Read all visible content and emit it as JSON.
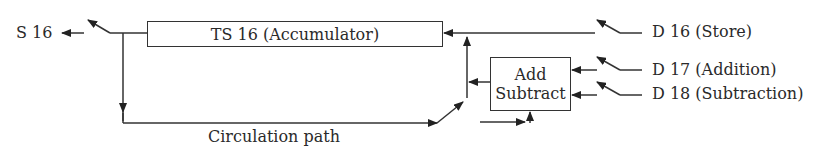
{
  "diagram": {
    "output_label": "S 16",
    "accumulator_label": "TS 16 (Accumulator)",
    "adder_label_line1": "Add",
    "adder_label_line2": "Subtract",
    "circulation_label": "Circulation path",
    "inputs": [
      {
        "label": "D 16 (Store)"
      },
      {
        "label": "D 17 (Addition)"
      },
      {
        "label": "D 18 (Subtraction)"
      }
    ]
  }
}
